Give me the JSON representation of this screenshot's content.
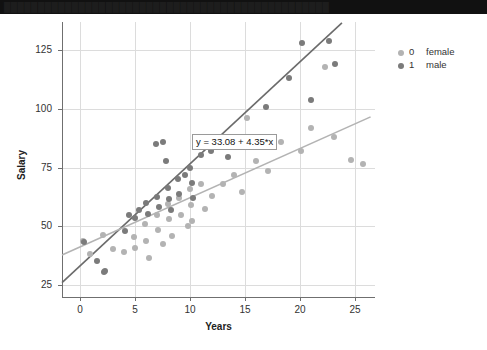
{
  "titlebar": {
    "text": "████████████████████████████████████████████████"
  },
  "legend": {
    "entries": [
      {
        "code": "0",
        "label": "female",
        "color": "#b3b3b3"
      },
      {
        "code": "1",
        "label": "male",
        "color": "#7b7b7b"
      }
    ]
  },
  "annotations": {
    "equation": {
      "text": "y = 33.08 + 4.35*x",
      "x_data": 10.2,
      "y_data": 86.5
    }
  },
  "chart_data": {
    "type": "scatter",
    "title": "",
    "xlabel": "Years",
    "ylabel": "Salary",
    "xlim": [
      -1.6,
      26.8
    ],
    "ylim": [
      20.0,
      137.0
    ],
    "xticks": [
      0,
      5,
      10,
      15,
      20,
      25
    ],
    "yticks": [
      25,
      50,
      75,
      100,
      125
    ],
    "grid": true,
    "legend_position": "top-right-outside",
    "colors": {
      "female": "#b3b3b3",
      "male": "#7b7b7b",
      "grid": "#dcdcdc",
      "axis": "#6f6f6f"
    },
    "series": [
      {
        "name": "female",
        "code": "0",
        "color": "#b3b3b3",
        "points": [
          [
            0.3,
            44.0
          ],
          [
            0.9,
            38.5
          ],
          [
            2.1,
            46.5
          ],
          [
            3.0,
            40.5
          ],
          [
            4.0,
            39.0
          ],
          [
            4.9,
            45.5
          ],
          [
            5.0,
            41.0
          ],
          [
            5.9,
            51.0
          ],
          [
            6.0,
            44.0
          ],
          [
            6.3,
            36.5
          ],
          [
            7.0,
            55.0
          ],
          [
            7.1,
            48.5
          ],
          [
            7.6,
            42.5
          ],
          [
            8.0,
            59.5
          ],
          [
            8.1,
            53.0
          ],
          [
            8.4,
            46.0
          ],
          [
            9.0,
            62.0
          ],
          [
            9.2,
            55.0
          ],
          [
            9.8,
            50.0
          ],
          [
            10.0,
            66.0
          ],
          [
            10.1,
            59.0
          ],
          [
            10.2,
            52.5
          ],
          [
            11.0,
            68.0
          ],
          [
            11.4,
            57.5
          ],
          [
            12.0,
            63.0
          ],
          [
            13.0,
            68.0
          ],
          [
            14.0,
            72.0
          ],
          [
            14.7,
            64.5
          ],
          [
            15.2,
            96.0
          ],
          [
            16.0,
            78.0
          ],
          [
            17.1,
            73.5
          ],
          [
            18.3,
            86.0
          ],
          [
            20.1,
            82.0
          ],
          [
            21.0,
            92.0
          ],
          [
            22.3,
            118.0
          ],
          [
            23.1,
            88.0
          ],
          [
            24.6,
            78.5
          ],
          [
            25.7,
            76.5
          ]
        ]
      },
      {
        "name": "male",
        "code": "1",
        "color": "#7b7b7b",
        "points": [
          [
            0.4,
            43.5
          ],
          [
            1.6,
            35.5
          ],
          [
            2.2,
            30.5
          ],
          [
            2.3,
            31.0
          ],
          [
            4.1,
            48.0
          ],
          [
            4.5,
            55.0
          ],
          [
            5.0,
            53.5
          ],
          [
            5.4,
            57.0
          ],
          [
            6.0,
            60.0
          ],
          [
            6.2,
            55.5
          ],
          [
            6.9,
            85.0
          ],
          [
            7.0,
            62.5
          ],
          [
            7.2,
            58.5
          ],
          [
            7.6,
            86.0
          ],
          [
            7.8,
            78.0
          ],
          [
            8.0,
            66.5
          ],
          [
            8.1,
            61.5
          ],
          [
            8.3,
            57.0
          ],
          [
            8.9,
            70.0
          ],
          [
            9.0,
            64.0
          ],
          [
            9.6,
            72.0
          ],
          [
            10.0,
            75.0
          ],
          [
            10.2,
            68.5
          ],
          [
            10.3,
            62.0
          ],
          [
            11.0,
            80.5
          ],
          [
            11.9,
            82.0
          ],
          [
            13.5,
            79.5
          ],
          [
            16.9,
            101.0
          ],
          [
            19.0,
            113.0
          ],
          [
            20.2,
            128.0
          ],
          [
            21.0,
            104.0
          ],
          [
            22.6,
            129.0
          ],
          [
            23.2,
            119.0
          ]
        ]
      }
    ],
    "fits": [
      {
        "name": "male-fit",
        "series": "male",
        "color": "#6b6b6b",
        "equation": "y = 33.08 + 4.35*x",
        "intercept": 33.08,
        "slope": 4.35,
        "x_start": -1.6,
        "x_end": 23.8
      },
      {
        "name": "female-fit",
        "series": "female",
        "color": "#b3b3b3",
        "intercept": 41.2,
        "slope": 2.1,
        "x_start": -1.6,
        "x_end": 26.4
      }
    ]
  }
}
